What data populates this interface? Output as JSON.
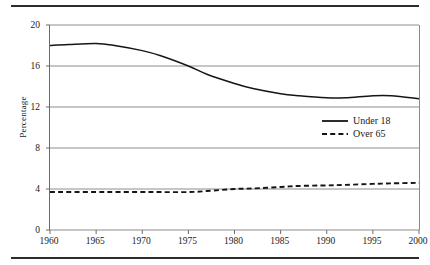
{
  "figure": {
    "y_axis_title": "Percentage",
    "rule_color": "#2b2b2b",
    "grid_color": "#8d8d8d",
    "axis_color": "#6a6a6a",
    "series_color": "#151515"
  },
  "legend": {
    "position": "inside-right",
    "entries": [
      {
        "label": "Under 18",
        "style": "solid",
        "sample": "solid-line-swatch"
      },
      {
        "label": "Over 65",
        "style": "dashed",
        "sample": "dashed-line-swatch"
      }
    ]
  },
  "axes": {
    "y_ticks": [
      "20",
      "16",
      "12",
      "8",
      "4",
      "0"
    ],
    "x_ticks": [
      "1960",
      "1965",
      "1970",
      "1975",
      "1980",
      "1985",
      "1990",
      "1995",
      "2000"
    ]
  },
  "chart_data": {
    "type": "line",
    "title": "",
    "subtitle": "",
    "xlabel": "",
    "ylabel": "Percentage",
    "xlim": [
      1960,
      2000
    ],
    "ylim": [
      0,
      20
    ],
    "yticks": [
      0,
      4,
      8,
      12,
      16,
      20
    ],
    "xticks": [
      1960,
      1965,
      1970,
      1975,
      1980,
      1985,
      1990,
      1995,
      2000
    ],
    "grid": "horizontal",
    "legend_position": "inside right, upper-middle",
    "x": [
      1960,
      1962,
      1965,
      1967,
      1970,
      1972,
      1975,
      1977,
      1980,
      1982,
      1985,
      1987,
      1990,
      1992,
      1995,
      1997,
      2000
    ],
    "series": [
      {
        "name": "Under 18",
        "style": "solid",
        "values": [
          18.0,
          18.1,
          18.2,
          18.0,
          17.5,
          17.0,
          16.0,
          15.2,
          14.3,
          13.8,
          13.3,
          13.1,
          12.9,
          12.9,
          13.1,
          13.1,
          12.8
        ]
      },
      {
        "name": "Over 65",
        "style": "dashed",
        "values": [
          3.7,
          3.7,
          3.7,
          3.7,
          3.7,
          3.7,
          3.7,
          3.8,
          4.0,
          4.05,
          4.2,
          4.3,
          4.35,
          4.4,
          4.5,
          4.55,
          4.6
        ]
      }
    ]
  }
}
